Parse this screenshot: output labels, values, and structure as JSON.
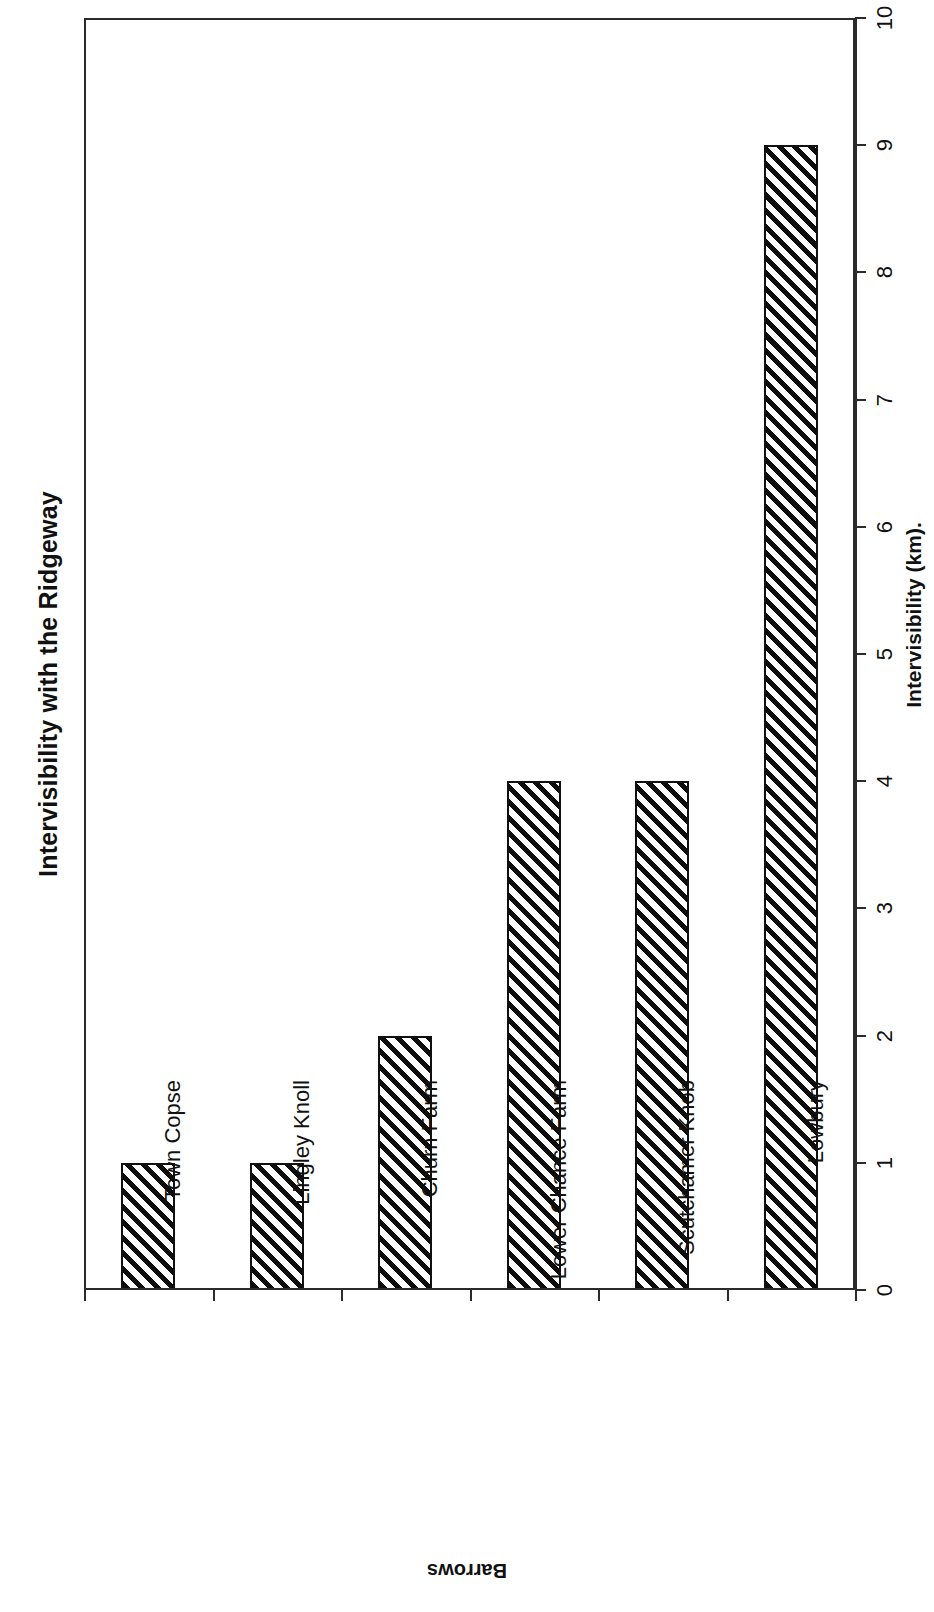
{
  "chart_data": {
    "type": "bar",
    "title": "Intervisibility with the Ridgeway",
    "orientation": "vertical-bars-on-rotated-page",
    "categories": [
      "Town Copse",
      "Lingley Knoll",
      "Churn Farm",
      "Lower Chance Farm",
      "Scutchamer Knob",
      "Lowbury"
    ],
    "values": [
      1,
      1,
      2,
      4,
      4,
      9
    ],
    "xlabel": "Barrows",
    "ylabel": "Intervisibility (km).",
    "ylim": [
      0,
      10
    ],
    "ytick_labels": [
      "0",
      "1",
      "2",
      "3",
      "4",
      "5",
      "6",
      "7",
      "8",
      "9",
      "10"
    ],
    "ytick_values": [
      0,
      1,
      2,
      3,
      4,
      5,
      6,
      7,
      8,
      9,
      10
    ],
    "grid": false,
    "legend": false,
    "bar_fill": "diagonal-hatch",
    "bar_edge_color": "#101010",
    "axis_color": "#2b2b2b",
    "background_color": "#ffffff"
  }
}
